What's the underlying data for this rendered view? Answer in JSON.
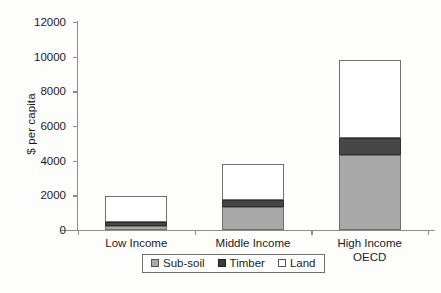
{
  "chart_data": {
    "type": "bar",
    "subtype": "stacked-bar",
    "title": "",
    "xlabel": "",
    "ylabel": "$ per capita",
    "ylim": [
      0,
      12000
    ],
    "yticks": [
      0,
      2000,
      4000,
      6000,
      8000,
      10000,
      12000
    ],
    "ytick_labels": [
      "0",
      "2000",
      "4000",
      "6000",
      "8000",
      "10000",
      "12000"
    ],
    "grid": false,
    "legend_position": "bottom-center",
    "categories": [
      "Low Income",
      "Middle Income",
      "High Income OECD"
    ],
    "category_label_lines": [
      [
        "Low Income"
      ],
      [
        "Middle Income"
      ],
      [
        "High Income",
        "OECD"
      ]
    ],
    "series": [
      {
        "name": "Sub-soil",
        "color": "#a9a9a9",
        "values": [
          230,
          1330,
          4300
        ]
      },
      {
        "name": "Timber",
        "color": "#474747",
        "values": [
          230,
          400,
          1000
        ]
      },
      {
        "name": "Land",
        "color": "#ffffff",
        "values": [
          1500,
          2070,
          4500
        ]
      }
    ],
    "totals": [
      1960,
      3800,
      9800
    ]
  },
  "legend": {
    "items": [
      {
        "label": "Sub-soil",
        "swatch": "subsoil"
      },
      {
        "label": "Timber",
        "swatch": "timber"
      },
      {
        "label": "Land",
        "swatch": "land"
      }
    ]
  }
}
